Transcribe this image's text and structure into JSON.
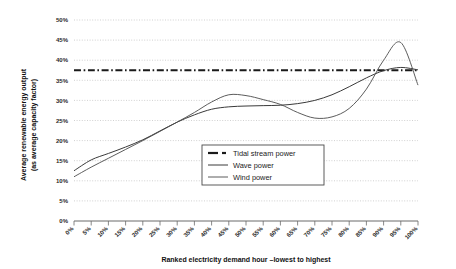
{
  "chart_data": {
    "type": "line",
    "title": "",
    "xlabel": "Ranked electricity demand hour –lowest to highest",
    "ylabel": "Average renewable energy output (as average capacity factor)",
    "xlim": [
      0,
      100
    ],
    "ylim": [
      0,
      50
    ],
    "grid": true,
    "legend_position": "center-right",
    "x_tick_labels": [
      "0%",
      "5%",
      "10%",
      "15%",
      "20%",
      "25%",
      "30%",
      "35%",
      "40%",
      "45%",
      "50%",
      "55%",
      "60%",
      "65%",
      "70%",
      "75%",
      "80%",
      "85%",
      "90%",
      "95%",
      "100%"
    ],
    "y_tick_labels": [
      "0%",
      "5%",
      "10%",
      "15%",
      "20%",
      "25%",
      "30%",
      "35%",
      "40%",
      "45%",
      "50%"
    ],
    "x": [
      0,
      5,
      10,
      15,
      20,
      25,
      30,
      35,
      40,
      45,
      50,
      55,
      60,
      65,
      70,
      75,
      80,
      85,
      90,
      95,
      100
    ],
    "series": [
      {
        "name": "Tidal stream power",
        "style": "dash-dot",
        "width": 2.2,
        "color": "#1a1a1a",
        "values": [
          37.5,
          37.5,
          37.5,
          37.5,
          37.5,
          37.5,
          37.5,
          37.5,
          37.5,
          37.5,
          37.5,
          37.5,
          37.5,
          37.5,
          37.5,
          37.5,
          37.5,
          37.5,
          37.5,
          37.5,
          37.5
        ]
      },
      {
        "name": "Wave power",
        "style": "solid",
        "width": 1.0,
        "color": "#3a3a3a",
        "values": [
          12.5,
          15.2,
          16.8,
          18.4,
          20.2,
          22.4,
          24.6,
          26.4,
          27.8,
          28.4,
          28.6,
          28.7,
          28.8,
          29.2,
          30.0,
          31.4,
          33.4,
          35.6,
          37.4,
          38.2,
          37.6
        ]
      },
      {
        "name": "Wind power",
        "style": "solid",
        "width": 0.9,
        "color": "#4a4a4a",
        "values": [
          11.0,
          13.4,
          15.6,
          17.8,
          20.0,
          22.3,
          24.6,
          27.0,
          29.6,
          31.4,
          31.2,
          30.2,
          29.0,
          27.0,
          25.6,
          25.9,
          28.0,
          32.8,
          40.0,
          44.4,
          33.8
        ]
      }
    ],
    "annotations": []
  },
  "axes": {
    "y_axis_label": "Average renewable energy output",
    "y_axis_label_line2": "(as average capacity factor)",
    "x_axis_label": "Ranked electricity demand hour –lowest to highest"
  },
  "legend": {
    "items": [
      {
        "label": "Tidal stream power",
        "style": "dash-dot"
      },
      {
        "label": "Wave power",
        "style": "solid"
      },
      {
        "label": "Wind power",
        "style": "solid-thin"
      }
    ]
  },
  "colors": {
    "grid": "#bdbdbd",
    "axis": "#6b6b6b",
    "text": "#1a1a1a",
    "series_tidal": "#1a1a1a",
    "series_wave": "#3a3a3a",
    "series_wind": "#4a4a4a"
  }
}
